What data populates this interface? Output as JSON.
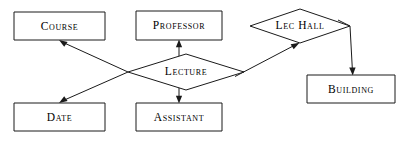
{
  "diagram": {
    "type": "er-diagram",
    "background_color": "#ffffff",
    "line_color": "#1a1a1a",
    "text_color": "#000000",
    "entities": [
      {
        "id": "course",
        "label": "Course",
        "shape": "rectangle",
        "x": 14,
        "y": 12,
        "width": 91,
        "height": 28
      },
      {
        "id": "professor",
        "label": "Professor",
        "shape": "rectangle",
        "x": 136,
        "y": 11,
        "width": 86,
        "height": 29
      },
      {
        "id": "date",
        "label": "Date",
        "shape": "rectangle",
        "x": 14,
        "y": 103,
        "width": 91,
        "height": 28
      },
      {
        "id": "assistant",
        "label": "Assistant",
        "shape": "rectangle",
        "x": 136,
        "y": 103,
        "width": 86,
        "height": 28
      },
      {
        "id": "building",
        "label": "Building",
        "shape": "rectangle",
        "x": 307,
        "y": 75,
        "width": 88,
        "height": 28
      }
    ],
    "relationships": [
      {
        "id": "lecture",
        "label": "Lecture",
        "shape": "diamond",
        "cx": 186,
        "cy": 72,
        "rx": 58,
        "ry": 18
      },
      {
        "id": "lec-hall",
        "label": "Lec Hall",
        "shape": "diamond",
        "cx": 300,
        "cy": 26,
        "rx": 50,
        "ry": 17
      }
    ],
    "connectors": [
      {
        "id": "lecture-to-course",
        "from": "lecture",
        "to": "course",
        "arrow_at": "course"
      },
      {
        "id": "lecture-to-professor",
        "from": "lecture",
        "to": "professor",
        "arrow_at": "professor"
      },
      {
        "id": "lecture-to-date",
        "from": "lecture",
        "to": "date",
        "arrow_at": "date"
      },
      {
        "id": "lecture-to-assistant",
        "from": "lecture",
        "to": "assistant",
        "arrow_at": "assistant"
      },
      {
        "id": "lecture-to-lec-hall",
        "from": "lecture",
        "to": "lec-hall",
        "arrow_at": "lec-hall"
      },
      {
        "id": "lec-hall-to-building",
        "from": "lec-hall",
        "to": "building",
        "arrow_at": "building"
      }
    ]
  }
}
